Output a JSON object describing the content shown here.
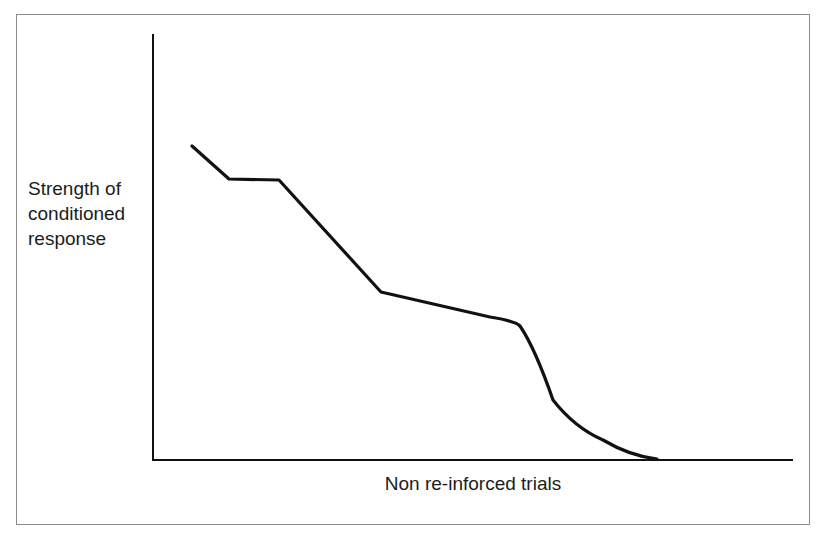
{
  "figure": {
    "background_color": "#ffffff",
    "frame_color": "#8b8b8b",
    "ink_color": "#111111",
    "y_axis_label": "Strength of\nconditioned\nresponse",
    "x_axis_label": "Non re-inforced trials"
  },
  "chart_data": {
    "type": "line",
    "title": "",
    "xlabel": "Non re-inforced trials",
    "ylabel": "Strength of conditioned response",
    "grid": false,
    "legend": null,
    "axis_style": "open-L (left spine and bottom spine only, no ticks, no tick labels)",
    "xlim": [
      0,
      100
    ],
    "ylim": [
      0,
      100
    ],
    "x_tick_labels": [],
    "y_tick_labels": [],
    "annotations": [],
    "series": [
      {
        "name": "Extinction of conditioned response",
        "color": "#111111",
        "line_width": 3,
        "marker": "none",
        "x": [
          6.3,
          12.0,
          19.8,
          35.7,
          52.6,
          57.0,
          62.5,
          70.3,
          78.4,
          100.0
        ],
        "y": [
          73.5,
          65.8,
          65.5,
          39.2,
          32.1,
          28.9,
          20.0,
          9.0,
          0.6,
          0.0
        ],
        "points_px": [
          [
            192,
            146
          ],
          [
            229,
            179
          ],
          [
            279,
            180
          ],
          [
            381,
            292
          ],
          [
            490,
            317
          ],
          [
            518,
            322
          ],
          [
            553,
            400
          ],
          [
            603,
            437
          ],
          [
            655,
            459
          ],
          [
            793,
            459
          ]
        ]
      }
    ]
  }
}
